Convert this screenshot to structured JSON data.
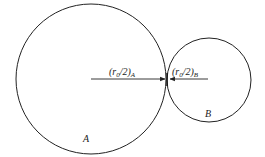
{
  "diagram": {
    "circles": [
      {
        "id": "A",
        "label": "A",
        "cx": 91,
        "cy": 79,
        "r": 75
      },
      {
        "id": "B",
        "label": "B",
        "cx": 209,
        "cy": 80,
        "r": 42
      }
    ],
    "arrows": [
      {
        "label_main": "(r",
        "label_sub0": "0",
        "label_mid": "/2)",
        "label_sub": "A",
        "from": [
          91,
          79
        ],
        "to": [
          166,
          79
        ]
      },
      {
        "label_main": "(r",
        "label_sub0": "0",
        "label_mid": "/2)",
        "label_sub": "B",
        "from": [
          208,
          79
        ],
        "to": [
          170,
          79
        ]
      }
    ],
    "stroke_color": "#222222"
  }
}
